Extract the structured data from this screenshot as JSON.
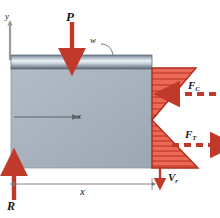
{
  "figure": {
    "colors": {
      "load_arrow": "#c0392b",
      "stress_fill": "#e8513c",
      "stress_line": "#b02a1c",
      "concrete": "#a9b3bd",
      "plate_light": "#e4eaef",
      "plate_dark": "#5f6f7e",
      "axis_line": "#8a8a8a",
      "text": "#1a1a1a"
    },
    "labels": {
      "point_load": "P",
      "distributed_load": "w",
      "y_axis": "y",
      "neutral_axis": "x",
      "dimension": "x",
      "reaction": "R",
      "compression_force": "F",
      "compression_force_sub": "C",
      "tension_force": "F",
      "tension_force_sub": "T",
      "shear_force": "V",
      "shear_force_sub": "r"
    },
    "beam": {
      "left": 11,
      "right": 152,
      "top": 55,
      "bottom": 168,
      "plate_top": 55,
      "plate_bottom": 70
    },
    "stress_block": {
      "type": "bending-stress-distribution",
      "apex_x": 152,
      "tip_x": 198,
      "neutral_axis_y": 120,
      "top_y": 68,
      "bottom_y": 168,
      "hatch_count_compression": 8,
      "hatch_count_tension": 9
    }
  }
}
